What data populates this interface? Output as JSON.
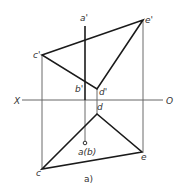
{
  "figure": {
    "caption": "a)",
    "axis": {
      "left_label": "X",
      "right_label": "O"
    },
    "points": {
      "a_prime": "a'",
      "b_prime": "b'",
      "c_prime": "c'",
      "d_prime": "d'",
      "e_prime": "e'",
      "c": "c",
      "d": "d",
      "e": "e",
      "ab": "a(b)"
    }
  },
  "colors": {
    "thick_line": "#1a1a1a",
    "thin_line": "#444444",
    "axis_line": "#666666",
    "text": "#333333"
  }
}
